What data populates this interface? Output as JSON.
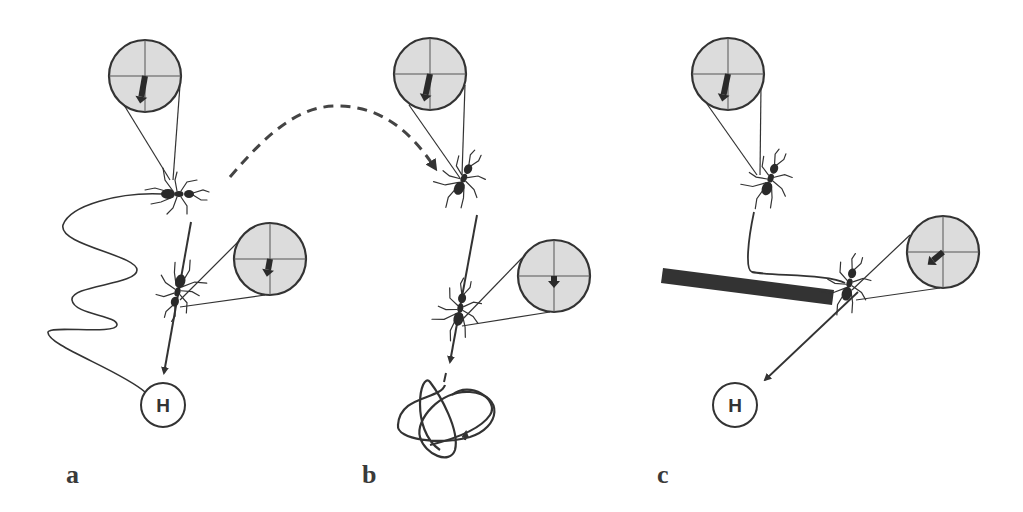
{
  "colors": {
    "ink": "#333333",
    "compass_fill": "#dcdcdc",
    "barrier": "#333333",
    "background": "#ffffff"
  },
  "panels": [
    {
      "label": "a",
      "label_pos": [
        66,
        462
      ],
      "home_label": "H",
      "description": "Ant reaches home via winding outbound path, then walks straight back; compass insets show heading toward home"
    },
    {
      "label": "b",
      "label_pos": [
        362,
        462
      ],
      "description": "Ant displaced (dashed arrow) walks home vector then performs search loop"
    },
    {
      "label": "c",
      "label_pos": [
        657,
        462
      ],
      "home_label": "H",
      "description": "Ant detours around barrier and adjusts heading toward home"
    }
  ],
  "compasses": [
    {
      "id": "a1",
      "cx": 145,
      "cy": 76,
      "r": 36,
      "arrow_angle_deg": 190,
      "arrow_len": 28
    },
    {
      "id": "a2",
      "cx": 270,
      "cy": 259,
      "r": 36,
      "arrow_angle_deg": 190,
      "arrow_len": 18
    },
    {
      "id": "b1",
      "cx": 430,
      "cy": 74,
      "r": 36,
      "arrow_angle_deg": 192,
      "arrow_len": 28
    },
    {
      "id": "b2",
      "cx": 554,
      "cy": 276,
      "r": 36,
      "arrow_angle_deg": 180,
      "arrow_len": 12
    },
    {
      "id": "c1",
      "cx": 728,
      "cy": 74,
      "r": 36,
      "arrow_angle_deg": 192,
      "arrow_len": 28
    },
    {
      "id": "c2",
      "cx": 943,
      "cy": 252,
      "r": 36,
      "arrow_angle_deg": 230,
      "arrow_len": 20
    }
  ],
  "home_nests": [
    {
      "id": "home-a",
      "cx": 163,
      "cy": 405,
      "r": 22,
      "label": "H"
    },
    {
      "id": "home-c",
      "cx": 735,
      "cy": 405,
      "r": 22,
      "label": "H"
    }
  ]
}
